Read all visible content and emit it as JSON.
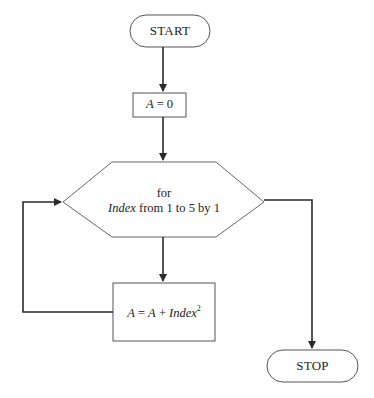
{
  "diagram": {
    "type": "flowchart",
    "nodes": {
      "start": {
        "shape": "terminal",
        "label": "START"
      },
      "init": {
        "shape": "process",
        "var": "A",
        "op": " = ",
        "value": "0"
      },
      "loop": {
        "shape": "hexagon-loop",
        "line1": "for",
        "line2_var": "Index",
        "line2_rest": " from 1 to 5 by 1"
      },
      "body": {
        "shape": "process",
        "lhs": "A",
        "eq": " = ",
        "rhs_a": "A",
        "plus": " + ",
        "rhs_index": "Index",
        "exponent": "2"
      },
      "stop": {
        "shape": "terminal",
        "label": "STOP"
      }
    },
    "edges": [
      {
        "from": "start",
        "to": "init"
      },
      {
        "from": "init",
        "to": "loop"
      },
      {
        "from": "loop",
        "to": "body",
        "label": ""
      },
      {
        "from": "body",
        "to": "loop",
        "label": ""
      },
      {
        "from": "loop",
        "to": "stop",
        "label": ""
      }
    ],
    "colors": {
      "line": "#2a2a2a",
      "shape_border": "#555555",
      "background": "#ffffff"
    }
  }
}
